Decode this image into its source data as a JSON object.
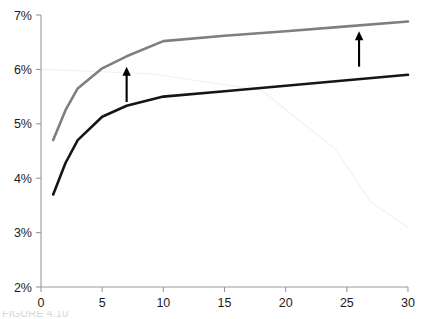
{
  "chart_data": {
    "type": "line",
    "title": "",
    "subtitle": "",
    "xlabel": "",
    "ylabel": "",
    "xlim": [
      0,
      30
    ],
    "ylim": [
      2,
      7
    ],
    "grid": false,
    "legend": "none",
    "x_ticks": [
      0,
      5,
      10,
      15,
      20,
      25,
      30
    ],
    "x_tick_labels": [
      "0",
      "5",
      "10",
      "15",
      "20",
      "25",
      "30"
    ],
    "y_ticks": [
      2,
      3,
      4,
      5,
      6,
      7
    ],
    "y_tick_labels": [
      "2%",
      "3%",
      "4%",
      "5%",
      "6%",
      "7%"
    ],
    "y_unit": "%",
    "series": [
      {
        "name": "upper-curve",
        "color": "#7f7f7f",
        "width": 2.6,
        "x": [
          1,
          2,
          3,
          5,
          7,
          10,
          15,
          20,
          25,
          30
        ],
        "values": [
          4.7,
          5.25,
          5.65,
          6.02,
          6.24,
          6.52,
          6.62,
          6.7,
          6.79,
          6.88
        ]
      },
      {
        "name": "lower-curve",
        "color": "#151515",
        "width": 2.6,
        "x": [
          1,
          2,
          3,
          5,
          7,
          10,
          15,
          20,
          25,
          30
        ],
        "values": [
          3.7,
          4.28,
          4.7,
          5.13,
          5.33,
          5.5,
          5.6,
          5.7,
          5.8,
          5.9
        ]
      }
    ],
    "annotations": [
      {
        "name": "arrow-left",
        "type": "arrow-up",
        "x": 7,
        "y_from": 5.4,
        "y_to": 6.05,
        "color": "#000000"
      },
      {
        "name": "arrow-right",
        "type": "arrow-up",
        "x": 26,
        "y_from": 6.05,
        "y_to": 6.7,
        "color": "#000000"
      }
    ],
    "artifacts": [
      {
        "name": "scan-streak",
        "points": [
          [
            0,
            6.0
          ],
          [
            9,
            5.92
          ],
          [
            18,
            5.62
          ],
          [
            22,
            4.9
          ],
          [
            24,
            4.55
          ],
          [
            27,
            3.55
          ],
          [
            30,
            3.1
          ]
        ],
        "color": "#f1f1f1"
      }
    ]
  },
  "caption": {
    "cut_off_text": "FIGURE 4.10"
  }
}
